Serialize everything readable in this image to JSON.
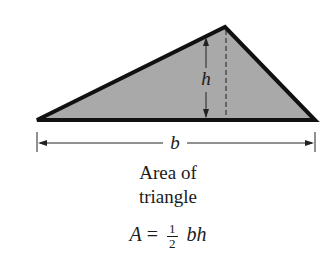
{
  "diagram": {
    "labels": {
      "height": "h",
      "base": "b"
    },
    "caption": {
      "line1": "Area of",
      "line2": "triangle"
    },
    "formula": {
      "lhs": "A",
      "equals": "=",
      "numerator": "1",
      "denominator": "2",
      "rhs": "bh"
    },
    "colors": {
      "fill": "#a9a9a9",
      "stroke": "#111111",
      "background": "#ffffff"
    }
  }
}
